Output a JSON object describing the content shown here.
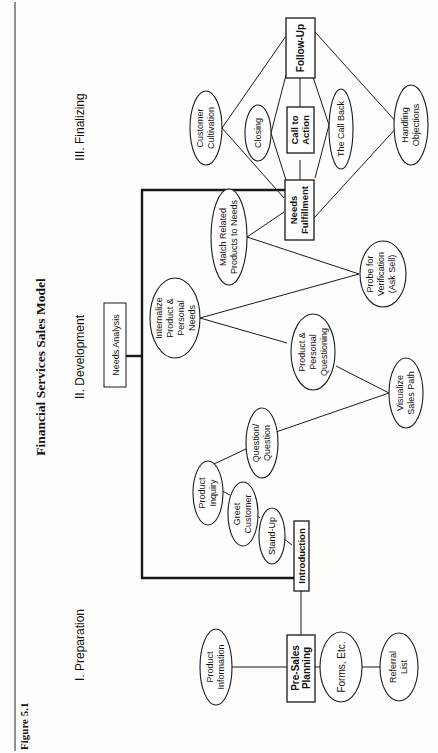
{
  "figure_label": "Figure 5.1",
  "title": "Financial Services Sales Model",
  "orientation": "rotated 90 degrees counter-clockwise",
  "phases": [
    {
      "id": "preparation",
      "label": "I. Preparation"
    },
    {
      "id": "development",
      "label": "II. Development"
    },
    {
      "id": "finalizing",
      "label": "III. Finalizing"
    }
  ],
  "boxes": {
    "needs_analysis": "Needs Analysis",
    "pre_sales_planning": [
      "Pre-Sales",
      "Planning"
    ],
    "introduction": "Introduction",
    "needs_fulfillment": [
      "Needs",
      "Fulfillment"
    ],
    "call_to_action": [
      "Call to",
      "Action"
    ],
    "follow_up": "Follow-Up"
  },
  "ellipses": {
    "product_information": [
      "Product",
      "Information"
    ],
    "forms_etc": [
      "Forms, Etc."
    ],
    "referral_list": [
      "Referral",
      "List"
    ],
    "stand_up": [
      "Stand-Up"
    ],
    "greet_customer": [
      "Greet",
      "Customer"
    ],
    "product_inquiry": [
      "Product",
      "Inquiry"
    ],
    "question_question": [
      "Question/",
      "Question"
    ],
    "visualize_sales_path": [
      "Visualize",
      "Sales Path"
    ],
    "product_personal_questioning": [
      "Product &",
      "Personal",
      "Questioning"
    ],
    "internalize_needs": [
      "Internalize",
      "Product &",
      "Personal",
      "Needs"
    ],
    "probe_for_verification": [
      "Probe for",
      "Verification",
      "(Ask Sell)"
    ],
    "match_related_products": [
      "Match Related",
      "Products to Needs"
    ],
    "customer_cultivation": [
      "Customer",
      "Cultivation"
    ],
    "closing": [
      "Closing"
    ],
    "the_call_back": [
      "The Call Back"
    ],
    "handling_objections": [
      "Handling",
      "Objections"
    ]
  },
  "edges": [
    [
      "product_information",
      "pre_sales_planning"
    ],
    [
      "pre_sales_planning",
      "forms_etc"
    ],
    [
      "forms_etc",
      "referral_list"
    ],
    [
      "pre_sales_planning",
      "introduction"
    ],
    [
      "introduction",
      "stand_up"
    ],
    [
      "stand_up",
      "greet_customer"
    ],
    [
      "greet_customer",
      "product_inquiry"
    ],
    [
      "product_inquiry",
      "question_question"
    ],
    [
      "question_question",
      "visualize_sales_path"
    ],
    [
      "visualize_sales_path",
      "product_personal_questioning"
    ],
    [
      "product_personal_questioning",
      "internalize_needs"
    ],
    [
      "internalize_needs",
      "probe_for_verification"
    ],
    [
      "probe_for_verification",
      "match_related_products"
    ],
    [
      "match_related_products",
      "needs_fulfillment"
    ],
    [
      "needs_fulfillment",
      "customer_cultivation"
    ],
    [
      "customer_cultivation",
      "follow_up"
    ],
    [
      "needs_fulfillment",
      "closing"
    ],
    [
      "closing",
      "follow_up"
    ],
    [
      "needs_fulfillment",
      "call_to_action"
    ],
    [
      "call_to_action",
      "follow_up"
    ],
    [
      "needs_fulfillment",
      "the_call_back"
    ],
    [
      "the_call_back",
      "follow_up"
    ],
    [
      "needs_fulfillment",
      "handling_objections"
    ],
    [
      "handling_objections",
      "follow_up"
    ],
    [
      "needs_analysis",
      "bracket:introduction-to-needs_fulfillment"
    ]
  ]
}
